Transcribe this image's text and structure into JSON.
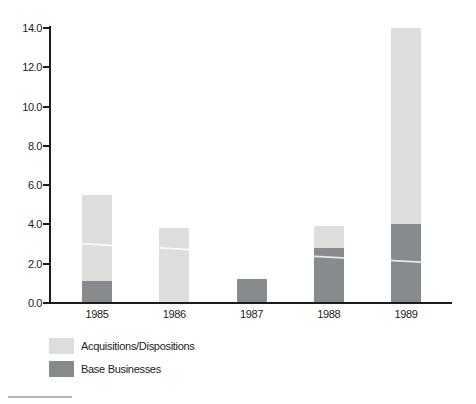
{
  "figure": {
    "background_color": "#ffffff",
    "axis_color": "#1c1c1c"
  },
  "chart_data": {
    "type": "bar",
    "stacked": true,
    "title": "",
    "xlabel": "",
    "ylabel": "",
    "categories": [
      "1985",
      "1986",
      "1987",
      "1988",
      "1989"
    ],
    "series": [
      {
        "name": "Acquisitions/Dispositions",
        "color": "#dcdedb",
        "values": [
          4.4,
          3.8,
          0,
          1.1,
          10.0
        ]
      },
      {
        "name": "Base Businesses",
        "color": "#878b8d",
        "values": [
          1.1,
          0,
          1.2,
          2.8,
          4.0
        ]
      }
    ],
    "stack_order_bottom_to_top": [
      "Base Businesses",
      "Acquisitions/Dispositions"
    ],
    "stack_totals": [
      5.5,
      3.8,
      1.2,
      3.9,
      14.0
    ],
    "ylim": [
      0,
      14
    ],
    "y_ticks": [
      0,
      2,
      4,
      6,
      8,
      10,
      12,
      14
    ],
    "y_tick_labels": [
      "0.0",
      "2.0",
      "4.0",
      "6.0",
      "8.0",
      "10.0",
      "12.0",
      "14.0"
    ],
    "grid": false,
    "legend_position": "bottom-left"
  }
}
